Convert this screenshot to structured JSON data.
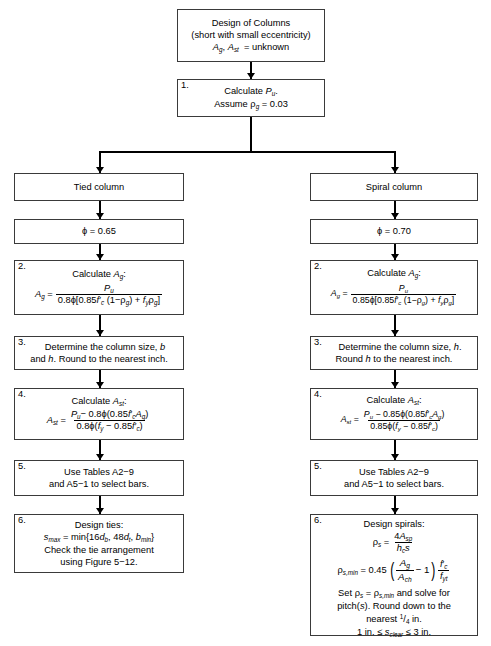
{
  "diagram": {
    "type": "flowchart",
    "accent_color": "#000000",
    "box_border_color": "#3a3a3a",
    "background": "#ffffff"
  },
  "start": {
    "line1": "Design of Columns",
    "line2": "(short with small eccentricity)",
    "line3_prefix": "A",
    "line3_sub1": "g",
    "line3_mid": ", A",
    "line3_sub2": "st",
    "line3_suffix": " = unknown"
  },
  "step1": {
    "num": "1.",
    "line1_a": "Calculate ",
    "line1_var": "P",
    "line1_sub": "u",
    "line1_b": ".",
    "line2_a": "Assume ",
    "line2_rho": "ρ",
    "line2_sub": "g",
    "line2_b": " = 0.03"
  },
  "branches": {
    "tied": {
      "header": "Tied column",
      "phi": "ϕ = 0.65",
      "phi_value": "0.65",
      "step2": {
        "num": "2.",
        "caption_a": "Calculate ",
        "caption_var": "A",
        "caption_sub": "g",
        "caption_b": ":",
        "lhs_var": "A",
        "lhs_sub": "g",
        "eq": "=",
        "numerator_var": "P",
        "numerator_sub": "u",
        "denominator": "0.8ϕ[0.85f'c (1−ρg) + fyρg]",
        "den_coef": "0.8ϕ[0.85"
      },
      "step3": {
        "num": "3.",
        "line1": "Determine the column size, b",
        "line1_pre": "Determine the column size, ",
        "line1_var": "b",
        "line2_pre": "and ",
        "line2_var": "h",
        "line2_post": ". Round to the nearest inch."
      },
      "step4": {
        "num": "4.",
        "caption_a": "Calculate ",
        "caption_var": "A",
        "caption_sub": "st",
        "caption_b": ":",
        "lhs_var": "A",
        "lhs_sub": "st",
        "eq": "=",
        "numerator": "Pu− 0.8ϕ(0.85f'cAg)",
        "denominator": "0.8ϕ(fy − 0.85f'c)"
      },
      "step5": {
        "num": "5.",
        "line1": "Use Tables A2−9",
        "line2": "and A5−1 to select bars."
      },
      "step6": {
        "num": "6.",
        "line1": "Design ties:",
        "line2": "smax = min{16db, 48dt, bmin}",
        "line3": "Check the tie arrangement",
        "line4": "using Figure 5−12."
      }
    },
    "spiral": {
      "header": "Spiral column",
      "phi": "ϕ = 0.70",
      "phi_value": "0.70",
      "step2": {
        "num": "2.",
        "caption_a": "Calculate ",
        "caption_var": "A",
        "caption_sub": "g",
        "caption_b": ":",
        "lhs_var": "A",
        "lhs_sub": "g",
        "eq": "=",
        "numerator_var": "P",
        "numerator_sub": "u",
        "denominator": "0.85ϕ[0.85f'c (1−ρg) + fyρg]",
        "den_coef": "0.85ϕ[0.85"
      },
      "step3": {
        "num": "3.",
        "line1_pre": "Determine the column size, ",
        "line1_var": "h",
        "line1_post": ".",
        "line2_pre": "Round ",
        "line2_var": "h",
        "line2_post": " to the nearest inch."
      },
      "step4": {
        "num": "4.",
        "caption_a": "Calculate ",
        "caption_var": "A",
        "caption_sub": "st",
        "caption_b": ":",
        "lhs_var": "A",
        "lhs_sub": "st",
        "eq": "=",
        "numerator": "Pu − 0.85ϕ(0.85f'cAg)",
        "denominator": "0.85ϕ(fy − 0.85f'c)"
      },
      "step5": {
        "num": "5.",
        "line1": "Use Tables A2−9",
        "line2": "and A5−1 to select bars."
      },
      "step6": {
        "num": "6.",
        "title": "Design spirals:",
        "eq1_lhs": "ρ",
        "eq1_lhs_sub": "s",
        "eq1_num": "4Asp",
        "eq1_den": "hcs",
        "eq2_lhs": "ρ",
        "eq2_lhs_sub": "s,min",
        "eq2_coef": "0.45",
        "eq2_fr1_num": "Ag",
        "eq2_fr1_den": "Ach",
        "eq2_minus": "− 1",
        "eq2_fr2_num": "f'c",
        "eq2_fr2_den": "fyt",
        "line_a": "Set ρs = ρs,min and solve for",
        "line_b": "pitch(s). Round down to the",
        "line_c": "nearest 1/4 in.",
        "line_d": "1 in. ≤ sclear ≤ 3 in."
      }
    }
  }
}
